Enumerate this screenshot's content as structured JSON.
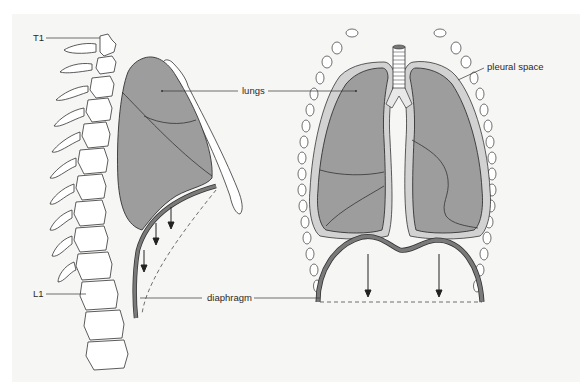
{
  "figure": {
    "colors": {
      "background": "#f6f6f4",
      "lung_fill": "#9d9d9d",
      "lung_outline": "#333333",
      "diaphragm": "#7a7a7a",
      "pleura": "#cfcfcf",
      "bone_fill": "#ffffff",
      "line": "#333333"
    }
  },
  "labels": {
    "t1": "T1",
    "l1": "L1",
    "lungs": "lungs",
    "diaphragm": "diaphragm",
    "pleural_space": "pleural space"
  }
}
